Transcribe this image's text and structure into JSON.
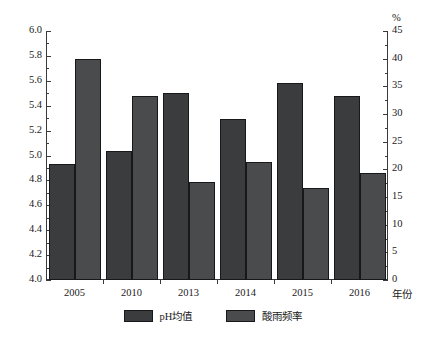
{
  "chart_data": {
    "type": "bar",
    "title": "",
    "subtitle": "",
    "categories": [
      "2005",
      "2010",
      "2013",
      "2014",
      "2015",
      "2016"
    ],
    "xlabel": "年份",
    "series": [
      {
        "name": "pH均值",
        "axis": "left",
        "color": "#3b3c3e",
        "values": [
          4.93,
          5.04,
          5.5,
          5.29,
          5.58,
          5.48
        ]
      },
      {
        "name": "酸雨频率",
        "axis": "right",
        "color": "#4a4b4d",
        "values": [
          40.0,
          33.2,
          17.8,
          21.4,
          16.6,
          19.3
        ]
      }
    ],
    "axes": {
      "left": {
        "label": "",
        "unit": "",
        "min": 4.0,
        "max": 6.0,
        "major_step": 0.2,
        "minor_step": 0.1,
        "ticks": [
          "4.0",
          "4.2",
          "4.4",
          "4.6",
          "4.8",
          "5.0",
          "5.2",
          "5.4",
          "5.6",
          "5.8",
          "6.0"
        ]
      },
      "right": {
        "label": "",
        "unit": "%",
        "min": 0,
        "max": 45,
        "major_step": 5,
        "minor_step": 2.5,
        "ticks": [
          "0",
          "5",
          "10",
          "15",
          "20",
          "25",
          "30",
          "35",
          "40",
          "45"
        ]
      }
    },
    "grid": false,
    "legend_position": "bottom-center",
    "legend": [
      "pH均值",
      "酸雨频率"
    ]
  }
}
